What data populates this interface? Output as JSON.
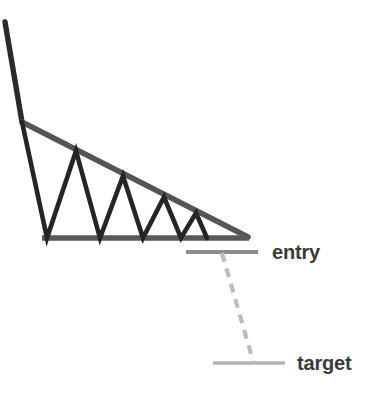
{
  "diagram": {
    "type": "technical-analysis-chart-pattern",
    "background_color": "#ffffff"
  },
  "labels": {
    "entry": "entry",
    "target": "target"
  },
  "colors": {
    "price_action": "#252525",
    "downtrend_line": "#2b2b2b",
    "resistance_line": "#555555",
    "support_line": "#595959",
    "entry_line": "#8c8c8c",
    "target_line": "#b4b4b4",
    "measure_line": "#bcbcbc",
    "label_text": "#3a3a3a"
  },
  "chart_data": {
    "type": "line",
    "xlabel": "",
    "ylabel": "",
    "grid": false,
    "legend": "none",
    "xlim": [
      0,
      370
    ],
    "ylim": [
      393,
      0
    ],
    "series": [
      {
        "name": "downtrend-line",
        "points": [
          [
            5,
            22
          ],
          [
            22,
            122
          ]
        ]
      },
      {
        "name": "resistance-trendline",
        "points": [
          [
            22,
            122
          ],
          [
            248,
            237
          ]
        ]
      },
      {
        "name": "support-trendline",
        "points": [
          [
            42,
            238
          ],
          [
            249,
            238
          ]
        ]
      },
      {
        "name": "price-action-zigzag",
        "points": [
          [
            22,
            122
          ],
          [
            47,
            238
          ],
          [
            76,
            151
          ],
          [
            100,
            238
          ],
          [
            123,
            176
          ],
          [
            143,
            238
          ],
          [
            164,
            197
          ],
          [
            181,
            238
          ],
          [
            196,
            213
          ],
          [
            207,
            238
          ]
        ]
      },
      {
        "name": "entry-level",
        "points": [
          [
            186,
            252
          ],
          [
            258,
            252
          ]
        ]
      },
      {
        "name": "measured-move-dashed",
        "points": [
          [
            222,
            253
          ],
          [
            253,
            361
          ]
        ]
      },
      {
        "name": "target-level",
        "points": [
          [
            213,
            363
          ],
          [
            285,
            363
          ]
        ]
      }
    ],
    "annotations": [
      {
        "text": "entry",
        "x": 272,
        "y": 259
      },
      {
        "text": "target",
        "x": 297,
        "y": 370
      }
    ]
  }
}
